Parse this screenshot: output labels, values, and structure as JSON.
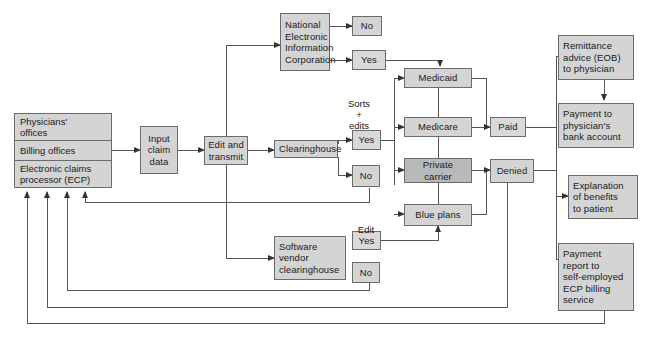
{
  "diagram": {
    "colors": {
      "node_fill": "#d4d4d4",
      "node_fill_dark": "#b9b9b9",
      "node_fill_light": "#d9d9d9",
      "node_border": "#6b6b6b",
      "line": "#555555",
      "background": "#ffffff",
      "text": "#1a1a1a"
    },
    "sources": {
      "name": "claim-sources-group",
      "rows": [
        {
          "label": "Physicians'\noffices"
        },
        {
          "label": "Billing offices"
        },
        {
          "label": "Electronic claims\nprocessor (ECP)"
        }
      ]
    },
    "nodes": {
      "input_claim_data": "Input\nclaim\ndata",
      "edit_and_transmit": "Edit and\ntransmit",
      "neic": "National\nElectronic\nInformation\nCorporation",
      "neic_no": "No",
      "neic_yes": "Yes",
      "clearinghouse": "Clearinghouse",
      "clearinghouse_yes": "Yes",
      "clearinghouse_no": "No",
      "software_vendor": "Software\nvendor\nclearinghouse",
      "software_yes": "Yes",
      "software_no": "No",
      "medicaid": "Medicaid",
      "medicare": "Medicare",
      "private_carrier": "Private\ncarrier",
      "blue_plans": "Blue plans",
      "paid": "Paid",
      "denied": "Denied",
      "remittance": "Remittance\nadvice (EOB)\nto physician",
      "payment_bank": "Payment to\nphysician's\nbank account",
      "explanation": "Explanation\nof benefits\nto patient",
      "payment_report": "Payment\nreport to\nself-employed\nECP billing\nservice"
    },
    "labels": {
      "sorts_edits": "Sorts\n+\nedits",
      "edit": "Edit"
    }
  }
}
